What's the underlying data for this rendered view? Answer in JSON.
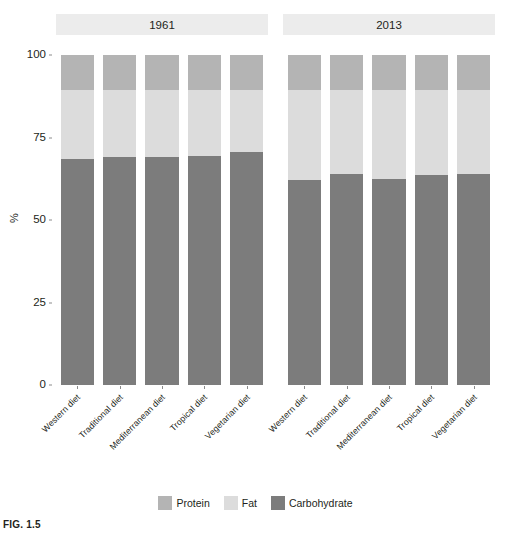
{
  "caption": "FIG. 1.5",
  "axis": {
    "y_title": "%",
    "y_ticks": [
      "100",
      "75",
      "50",
      "25",
      "0"
    ]
  },
  "legend": {
    "items": [
      {
        "label": "Protein",
        "color": "#b4b4b4"
      },
      {
        "label": "Fat",
        "color": "#dcdcdc"
      },
      {
        "label": "Carbohydrate",
        "color": "#7c7c7c"
      }
    ]
  },
  "chart_data": {
    "type": "bar",
    "title": "",
    "subtype": "stacked-percent",
    "xlabel": "",
    "ylabel": "%",
    "ylim": [
      0,
      100
    ],
    "grid": false,
    "legend_position": "bottom",
    "panels": [
      {
        "label": "1961",
        "categories": [
          "Western diet",
          "Traditional diet",
          "Mediterranean diet",
          "Tropical diet",
          "Vegetarian diet"
        ],
        "series": [
          {
            "name": "Carbohydrate",
            "color": "#7c7c7c",
            "values": [
              68.5,
              69.0,
              69.0,
              69.5,
              70.5
            ]
          },
          {
            "name": "Fat",
            "color": "#dcdcdc",
            "values": [
              21.0,
              20.5,
              20.5,
              20.0,
              19.0
            ]
          },
          {
            "name": "Protein",
            "color": "#b4b4b4",
            "values": [
              10.5,
              10.5,
              10.5,
              10.5,
              10.5
            ]
          }
        ]
      },
      {
        "label": "2013",
        "categories": [
          "Western diet",
          "Traditional diet",
          "Mediterranean diet",
          "Tropical diet",
          "Vegetarian diet"
        ],
        "series": [
          {
            "name": "Carbohydrate",
            "color": "#7c7c7c",
            "values": [
              62.0,
              64.0,
              62.5,
              63.5,
              64.0
            ]
          },
          {
            "name": "Fat",
            "color": "#dcdcdc",
            "values": [
              27.5,
              25.5,
              27.0,
              26.0,
              25.5
            ]
          },
          {
            "name": "Protein",
            "color": "#b4b4b4",
            "values": [
              10.5,
              10.5,
              10.5,
              10.5,
              10.5
            ]
          }
        ]
      }
    ]
  },
  "layout": {
    "plot_left": 56,
    "plot_top": 55,
    "plot_bottom": 385,
    "panel_width": 212,
    "panel_gap": 15,
    "panel_strip_color": "#ececec"
  }
}
